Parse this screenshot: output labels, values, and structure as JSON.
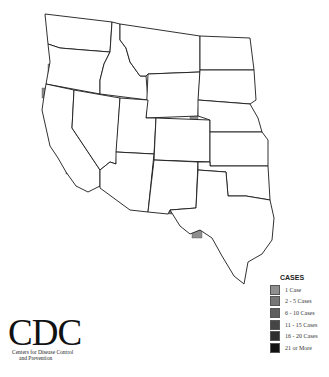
{
  "map": {
    "title": "",
    "region": "Western United States",
    "states": [
      {
        "name": "Washington",
        "path": "M45,14 L112,22 L110,52 L84,50 L60,48 L48,44 Z"
      },
      {
        "name": "Oregon",
        "path": "M48,44 L60,48 L84,50 L110,52 L104,64 L100,80 L100,94 L46,84 L50,62 Z"
      },
      {
        "name": "California",
        "path": "M46,84 L74,90 L72,128 L100,170 L100,186 L88,192 L76,186 L66,172 L58,158 L50,146 L46,128 L42,110 L44,96 Z"
      },
      {
        "name": "Idaho",
        "path": "M112,22 L120,24 L120,40 L126,48 L130,62 L140,76 L146,76 L148,100 L100,94 L100,80 L104,64 L110,52 Z"
      },
      {
        "name": "Nevada",
        "path": "M74,90 L120,98 L116,164 L110,162 L100,170 L72,128 Z"
      },
      {
        "name": "Montana",
        "path": "M120,24 L200,36 L200,72 L148,74 L146,76 L140,76 L130,62 L126,48 L120,40 Z"
      },
      {
        "name": "Wyoming",
        "path": "M148,74 L200,72 L198,116 L146,118 Z"
      },
      {
        "name": "Utah",
        "path": "M120,98 L148,100 L146,118 L156,118 L154,154 L116,152 Z"
      },
      {
        "name": "Arizona",
        "path": "M116,152 L154,154 L148,212 L130,210 L100,188 L100,170 L110,162 L116,164 Z"
      },
      {
        "name": "Colorado",
        "path": "M156,118 L210,120 L210,162 L154,160 Z"
      },
      {
        "name": "New Mexico",
        "path": "M154,160 L198,162 L196,208 L170,210 L168,214 L148,212 Z"
      },
      {
        "name": "North Dakota",
        "path": "M200,36 L250,38 L254,70 L200,70 Z"
      },
      {
        "name": "South Dakota",
        "path": "M200,70 L254,70 L256,100 L250,104 L198,100 Z"
      },
      {
        "name": "Nebraska",
        "path": "M198,100 L250,104 L258,118 L262,132 L210,132 L210,120 L198,116 Z"
      },
      {
        "name": "Kansas",
        "path": "M210,132 L262,132 L268,140 L268,166 L210,166 Z"
      },
      {
        "name": "Oklahoma",
        "path": "M198,162 L210,162 L210,166 L268,166 L270,200 L258,198 L246,196 L228,196 L226,172 L198,170 Z"
      },
      {
        "name": "Texas",
        "path": "M198,170 L226,172 L228,196 L246,196 L258,198 L270,200 L274,218 L272,240 L262,254 L248,262 L244,284 L234,276 L222,256 L212,238 L200,230 L190,234 L180,226 L170,210 L196,208 Z"
      }
    ],
    "counties_cases": [
      {
        "x": 80,
        "y": 36,
        "w": 9,
        "h": 10,
        "cases": "1 Case"
      },
      {
        "x": 94,
        "y": 52,
        "w": 8,
        "h": 6,
        "cases": "1 Case"
      },
      {
        "x": 104,
        "y": 52,
        "w": 6,
        "h": 8,
        "cases": "1 Case"
      },
      {
        "x": 70,
        "y": 58,
        "w": 10,
        "h": 6,
        "cases": "1 Case"
      },
      {
        "x": 48,
        "y": 64,
        "w": 10,
        "h": 10,
        "cases": "1 Case"
      },
      {
        "x": 60,
        "y": 70,
        "w": 10,
        "h": 12,
        "cases": "2 - 5 Cases"
      },
      {
        "x": 70,
        "y": 70,
        "w": 12,
        "h": 18,
        "cases": "2 - 5 Cases"
      },
      {
        "x": 52,
        "y": 84,
        "w": 12,
        "h": 8,
        "cases": "2 - 5 Cases"
      },
      {
        "x": 42,
        "y": 88,
        "w": 8,
        "h": 10,
        "cases": "1 Case"
      },
      {
        "x": 54,
        "y": 94,
        "w": 10,
        "h": 8,
        "cases": "1 Case"
      },
      {
        "x": 74,
        "y": 94,
        "w": 6,
        "h": 22,
        "cases": "2 - 5 Cases"
      },
      {
        "x": 56,
        "y": 106,
        "w": 10,
        "h": 8,
        "cases": "1 Case"
      },
      {
        "x": 62,
        "y": 114,
        "w": 10,
        "h": 8,
        "cases": "1 Case"
      },
      {
        "x": 58,
        "y": 130,
        "w": 12,
        "h": 10,
        "cases": "1 Case"
      },
      {
        "x": 76,
        "y": 138,
        "w": 14,
        "h": 10,
        "cases": "1 Case"
      },
      {
        "x": 62,
        "y": 154,
        "w": 16,
        "h": 10,
        "cases": "2 - 5 Cases"
      },
      {
        "x": 66,
        "y": 164,
        "w": 8,
        "h": 10,
        "cases": "2 - 5 Cases"
      },
      {
        "x": 76,
        "y": 178,
        "w": 24,
        "h": 8,
        "cases": "1 Case"
      },
      {
        "x": 128,
        "y": 64,
        "w": 8,
        "h": 12,
        "cases": "1 Case"
      },
      {
        "x": 134,
        "y": 86,
        "w": 8,
        "h": 6,
        "cases": "1 Case"
      },
      {
        "x": 102,
        "y": 80,
        "w": 10,
        "h": 14,
        "cases": "1 Case"
      },
      {
        "x": 156,
        "y": 54,
        "w": 8,
        "h": 6,
        "cases": "1 Case"
      },
      {
        "x": 172,
        "y": 76,
        "w": 12,
        "h": 6,
        "cases": "1 Case"
      },
      {
        "x": 168,
        "y": 86,
        "w": 8,
        "h": 6,
        "cases": "1 Case"
      },
      {
        "x": 104,
        "y": 118,
        "w": 12,
        "h": 16,
        "cases": "1 Case"
      },
      {
        "x": 120,
        "y": 104,
        "w": 8,
        "h": 10,
        "cases": "1 Case"
      },
      {
        "x": 120,
        "y": 114,
        "w": 10,
        "h": 10,
        "cases": "2 - 5 Cases"
      },
      {
        "x": 132,
        "y": 110,
        "w": 8,
        "h": 16,
        "cases": "6 - 10 Cases"
      },
      {
        "x": 116,
        "y": 136,
        "w": 10,
        "h": 8,
        "cases": "1 Case"
      },
      {
        "x": 124,
        "y": 144,
        "w": 16,
        "h": 8,
        "cases": "1 Case"
      },
      {
        "x": 140,
        "y": 146,
        "w": 14,
        "h": 10,
        "cases": "2 - 5 Cases"
      },
      {
        "x": 190,
        "y": 114,
        "w": 8,
        "h": 8,
        "cases": "1 Case"
      },
      {
        "x": 158,
        "y": 118,
        "w": 12,
        "h": 10,
        "cases": "1 Case"
      },
      {
        "x": 160,
        "y": 130,
        "w": 8,
        "h": 10,
        "cases": "1 Case"
      },
      {
        "x": 164,
        "y": 140,
        "w": 8,
        "h": 12,
        "cases": "2 - 5 Cases"
      },
      {
        "x": 174,
        "y": 140,
        "w": 10,
        "h": 12,
        "cases": "2 - 5 Cases"
      },
      {
        "x": 182,
        "y": 136,
        "w": 10,
        "h": 16,
        "cases": "2 - 5 Cases"
      },
      {
        "x": 188,
        "y": 124,
        "w": 6,
        "h": 14,
        "cases": "1 Case"
      },
      {
        "x": 190,
        "y": 150,
        "w": 10,
        "h": 10,
        "cases": "2 - 5 Cases"
      },
      {
        "x": 196,
        "y": 156,
        "w": 12,
        "h": 8,
        "cases": "1 Case"
      },
      {
        "x": 114,
        "y": 160,
        "w": 34,
        "h": 20,
        "cases": "16 - 20 Cases"
      },
      {
        "x": 114,
        "y": 180,
        "w": 10,
        "h": 10,
        "cases": "6 - 10 Cases"
      },
      {
        "x": 124,
        "y": 180,
        "w": 16,
        "h": 16,
        "cases": "11 - 15 Cases"
      },
      {
        "x": 140,
        "y": 176,
        "w": 10,
        "h": 16,
        "cases": "11 - 15 Cases"
      },
      {
        "x": 150,
        "y": 166,
        "w": 14,
        "h": 14,
        "cases": "21 or More"
      },
      {
        "x": 164,
        "y": 160,
        "w": 14,
        "h": 14,
        "cases": "21 or More"
      },
      {
        "x": 154,
        "y": 156,
        "w": 10,
        "h": 10,
        "cases": "11 - 15 Cases"
      },
      {
        "x": 164,
        "y": 174,
        "w": 12,
        "h": 10,
        "cases": "16 - 20 Cases"
      },
      {
        "x": 176,
        "y": 170,
        "w": 14,
        "h": 12,
        "cases": "6 - 10 Cases"
      },
      {
        "x": 184,
        "y": 164,
        "w": 10,
        "h": 8,
        "cases": "2 - 5 Cases"
      },
      {
        "x": 158,
        "y": 180,
        "w": 10,
        "h": 10,
        "cases": "2 - 5 Cases"
      },
      {
        "x": 160,
        "y": 190,
        "w": 14,
        "h": 10,
        "cases": "2 - 5 Cases"
      },
      {
        "x": 172,
        "y": 192,
        "w": 10,
        "h": 12,
        "cases": "2 - 5 Cases"
      },
      {
        "x": 168,
        "y": 202,
        "w": 12,
        "h": 12,
        "cases": "2 - 5 Cases"
      },
      {
        "x": 146,
        "y": 200,
        "w": 10,
        "h": 8,
        "cases": "1 Case"
      },
      {
        "x": 196,
        "y": 218,
        "w": 8,
        "h": 6,
        "cases": "1 Case"
      },
      {
        "x": 214,
        "y": 204,
        "w": 5,
        "h": 5,
        "cases": "1 Case"
      },
      {
        "x": 192,
        "y": 228,
        "w": 10,
        "h": 10,
        "cases": "1 Case"
      }
    ]
  },
  "legend": {
    "title": "CASES",
    "items": [
      {
        "label": "1 Case",
        "color": "#8f8f8f"
      },
      {
        "label": "2 - 5 Cases",
        "color": "#767676"
      },
      {
        "label": "6 - 10 Cases",
        "color": "#5f5f5f"
      },
      {
        "label": "11 - 15 Cases",
        "color": "#454545"
      },
      {
        "label": "16 - 20 Cases",
        "color": "#2e2e2e"
      },
      {
        "label": "21 or More",
        "color": "#111111"
      }
    ]
  },
  "logo": {
    "mark": "CDC",
    "line1": "Centers for Disease Control",
    "line2": "and Prevention"
  }
}
